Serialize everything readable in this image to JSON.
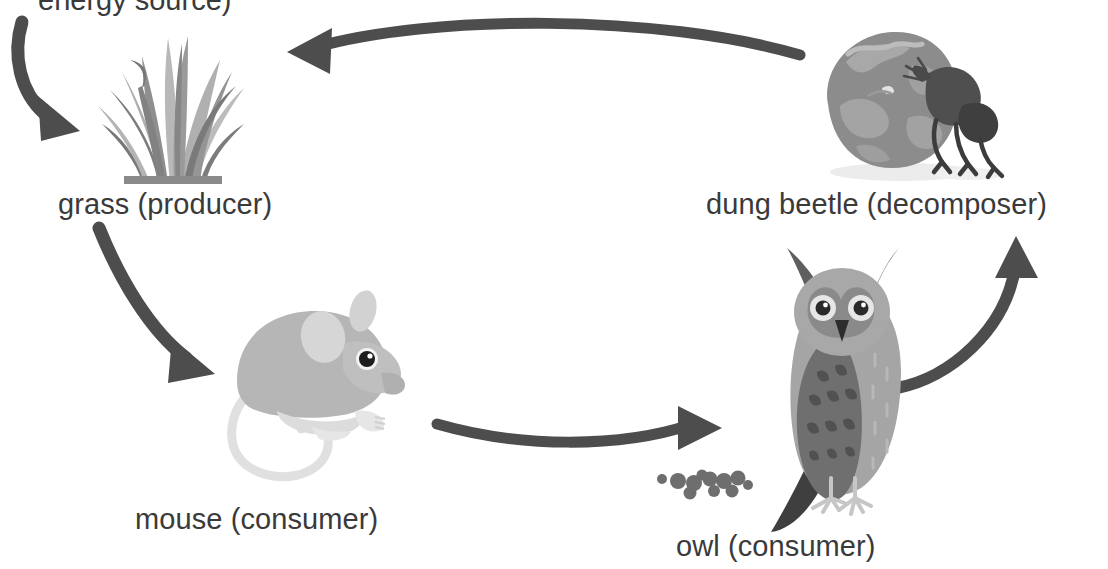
{
  "diagram": {
    "type": "food-chain-cycle",
    "title_partial": "energy source)",
    "title_note": "top line is cropped by the image edge",
    "background_color": "#ffffff",
    "text_color": "#3a3a3a",
    "arrow_color": "#4d4d4d",
    "nodes": [
      {
        "id": "grass",
        "label": "grass (producer)",
        "role": "producer",
        "icon": "grass-tuft-icon",
        "label_x": 58,
        "label_y": 190,
        "art_x": 88,
        "art_y": 20,
        "art_w": 165,
        "art_h": 165,
        "colors": {
          "dark": "#7d7d7d",
          "mid": "#939393",
          "light": "#a8a8a8",
          "pale": "#bcbcbc"
        }
      },
      {
        "id": "mouse",
        "label": "mouse (consumer)",
        "role": "consumer",
        "icon": "mouse-icon",
        "label_x": 135,
        "label_y": 505,
        "art_x": 215,
        "art_y": 285,
        "art_w": 190,
        "art_h": 200,
        "colors": {
          "body": "#b4b4b4",
          "belly": "#dcdcdc",
          "ear": "#d2d2d2",
          "eye": "#1f1f1f",
          "tail": "#e2e2e2"
        }
      },
      {
        "id": "owl",
        "label": "owl (consumer)",
        "role": "consumer",
        "icon": "owl-icon",
        "label_x": 676,
        "label_y": 532,
        "art_x": 760,
        "art_y": 248,
        "art_w": 165,
        "art_h": 290,
        "colors": {
          "wing": "#6f6f6f",
          "breast": "#a3a3a3",
          "face": "#8a8a8a",
          "beak": "#2d2d2d",
          "eye": "#2a2a2a",
          "tail": "#4a4a4a"
        }
      },
      {
        "id": "dung-beetle",
        "label": "dung beetle (decomposer)",
        "role": "decomposer",
        "icon": "dung-beetle-icon",
        "label_x": 706,
        "label_y": 190,
        "art_x": 812,
        "art_y": 24,
        "art_w": 200,
        "art_h": 160,
        "colors": {
          "ball": "#8c8c8c",
          "ball_light": "#a6a6a6",
          "beetle": "#4f4f4f",
          "beetle_dark": "#3c3c3c",
          "shadow": "#e8e8e8"
        }
      },
      {
        "id": "owl-pellets",
        "label": "",
        "icon": "owl-pellets-icon",
        "count": 11,
        "color": "#6e6e6e"
      }
    ],
    "arrows": [
      {
        "id": "sun-to-grass",
        "from": "energy source",
        "to": "grass",
        "direction": "down-right"
      },
      {
        "id": "beetle-to-grass",
        "from": "dung beetle",
        "to": "grass",
        "direction": "right-to-left"
      },
      {
        "id": "grass-to-mouse",
        "from": "grass",
        "to": "mouse",
        "direction": "down-right"
      },
      {
        "id": "mouse-to-owl",
        "from": "mouse",
        "to": "owl",
        "direction": "left-to-right"
      },
      {
        "id": "owl-to-beetle",
        "from": "owl",
        "to": "dung beetle",
        "direction": "up-right"
      }
    ]
  }
}
